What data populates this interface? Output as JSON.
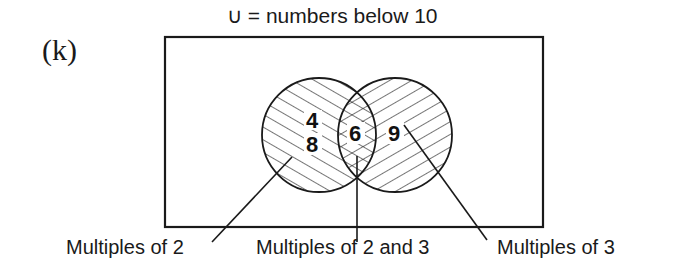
{
  "title": "∪ = numbers below 10",
  "part_label": "(k)",
  "universal_set": "numbers below 10",
  "sets": {
    "left": {
      "name": "Multiples of 2",
      "elements_only": [
        "4",
        "8"
      ]
    },
    "right": {
      "name": "Multiples of 3",
      "elements_only": [
        "9"
      ]
    },
    "intersection": {
      "name": "Multiples of 2 and 3",
      "elements": [
        "6"
      ]
    }
  },
  "numbers": {
    "n4": "4",
    "n8": "8",
    "n6": "6",
    "n9": "9"
  },
  "captions": {
    "left": "Multiples of 2",
    "middle": "Multiples of 2 and 3",
    "right": "Multiples of 3"
  },
  "colors": {
    "ink": "#1a1a1a",
    "background": "#ffffff"
  }
}
